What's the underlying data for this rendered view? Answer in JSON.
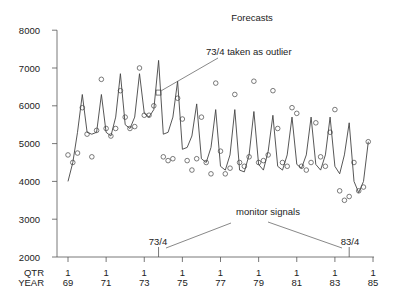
{
  "chart_data": {
    "type": "line",
    "title": "Forecasts",
    "xlabel_rows": [
      "QTR",
      "YEAR"
    ],
    "ylabel": "",
    "ylim": [
      2000,
      8000
    ],
    "yticks": [
      2000,
      3000,
      4000,
      5000,
      6000,
      7000,
      8000
    ],
    "xticks": [
      {
        "qtr": "1",
        "year": "69"
      },
      {
        "qtr": "1",
        "year": "71"
      },
      {
        "qtr": "1",
        "year": "73"
      },
      {
        "qtr": "1",
        "year": "75"
      },
      {
        "qtr": "1",
        "year": "77"
      },
      {
        "qtr": "1",
        "year": "79"
      },
      {
        "qtr": "1",
        "year": "81"
      },
      {
        "qtr": "1",
        "year": "83"
      },
      {
        "qtr": "1",
        "year": "85"
      }
    ],
    "x_start": "69/1",
    "grid": false,
    "series": [
      {
        "name": "Forecast",
        "style": "line",
        "values": [
          4000,
          4500,
          5300,
          6300,
          5300,
          5250,
          5300,
          6300,
          5300,
          5200,
          5700,
          6850,
          5500,
          5400,
          5700,
          6850,
          5800,
          5700,
          5900,
          7200,
          5250,
          5300,
          5700,
          6650,
          4850,
          4900,
          5200,
          6050,
          4600,
          4500,
          4900,
          5900,
          4400,
          4300,
          4700,
          5900,
          4300,
          4250,
          4700,
          5850,
          4450,
          4300,
          4800,
          5750,
          4400,
          4300,
          4700,
          5700,
          4450,
          4350,
          4700,
          5700,
          4450,
          4300,
          4700,
          5700,
          4400,
          4200,
          4700,
          5550,
          4000,
          3700,
          4000,
          5050
        ]
      },
      {
        "name": "Observed",
        "style": "circle",
        "values": [
          4700,
          4500,
          4750,
          5950,
          5250,
          4650,
          5350,
          6700,
          5400,
          5200,
          5400,
          6400,
          5700,
          5400,
          5450,
          7000,
          5750,
          5750,
          6000,
          6350,
          4650,
          4550,
          4600,
          6200,
          5650,
          4550,
          4300,
          4600,
          5700,
          4500,
          4200,
          6600,
          4800,
          4200,
          4350,
          6300,
          4500,
          4400,
          4650,
          6650,
          4500,
          4550,
          4700,
          6400,
          5400,
          4500,
          4400,
          5950,
          5800,
          4400,
          4300,
          4500,
          5550,
          4650,
          4400,
          5300,
          5900,
          3750,
          3500,
          3600,
          4500,
          3750,
          3850,
          5050
        ]
      }
    ],
    "annotations": [
      {
        "text": "73/4 taken as outlier",
        "points_to": "73/4"
      },
      {
        "text": "monitor signals",
        "points_to": [
          "73/4",
          "83/4"
        ]
      },
      {
        "text": "73/4",
        "type": "signal-marker"
      },
      {
        "text": "83/4",
        "type": "signal-marker"
      }
    ]
  },
  "labels": {
    "title": "Forecasts",
    "outlier_note": "73/4 taken as outlier",
    "monitor_note": "monitor signals",
    "signal_a": "73/4",
    "signal_b": "83/4",
    "qtr": "QTR",
    "year": "YEAR"
  }
}
